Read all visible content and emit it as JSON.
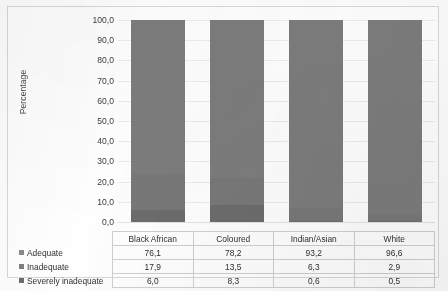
{
  "chart_data": {
    "type": "bar",
    "subtype": "stacked-bar-percent",
    "title": "",
    "xlabel": "",
    "ylabel": "Percentage",
    "ylim": [
      0,
      100
    ],
    "ytick_labels": [
      "100,0",
      "90,0",
      "80,0",
      "70,0",
      "60,0",
      "50,0",
      "40,0",
      "30,0",
      "20,0",
      "10,0",
      "0,0"
    ],
    "ytick_values": [
      100,
      90,
      80,
      70,
      60,
      50,
      40,
      30,
      20,
      10,
      0
    ],
    "grid": true,
    "legend_position": "table-left-column",
    "decimal_separator": ",",
    "categories": [
      "Black African",
      "Coloured",
      "Indian/Asian",
      "White"
    ],
    "series": [
      {
        "name": "Adequate",
        "values": [
          76.1,
          78.2,
          93.2,
          96.6
        ],
        "labels": [
          "76,1",
          "78,2",
          "93,2",
          "96,6"
        ],
        "color": "#7c7c7c"
      },
      {
        "name": "Inadequate",
        "values": [
          17.9,
          13.5,
          6.3,
          2.9
        ],
        "labels": [
          "17,9",
          "13,5",
          "6,3",
          "2,9"
        ],
        "color": "#787878"
      },
      {
        "name": "Severely inadequate",
        "values": [
          6.0,
          8.3,
          0.6,
          0.5
        ],
        "labels": [
          "6,0",
          "8,3",
          "0,6",
          "0,5"
        ],
        "color": "#6c6c6c"
      }
    ]
  },
  "axis": {
    "y_title": "Percentage"
  },
  "table": {
    "column_headers": [
      "Black African",
      "Coloured",
      "Indian/Asian",
      "White"
    ],
    "rows": [
      {
        "label": "Adequate",
        "values": [
          "76,1",
          "78,2",
          "93,2",
          "96,6"
        ]
      },
      {
        "label": "Inadequate",
        "values": [
          "17,9",
          "13,5",
          "6,3",
          "2,9"
        ]
      },
      {
        "label": "Severely inadequate",
        "values": [
          "6,0",
          "8,3",
          "0,6",
          "0,5"
        ]
      }
    ]
  }
}
